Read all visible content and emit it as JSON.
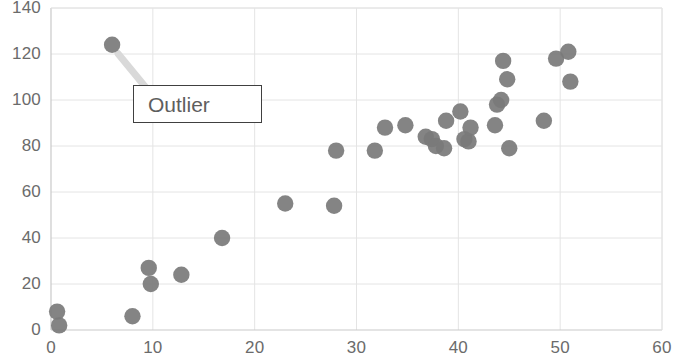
{
  "chart": {
    "type": "scatter",
    "title": "",
    "marker_color": "#7a7a7a",
    "grid_color": "#e4e4e4",
    "axis_color": "#d2d2d2",
    "tick_text_color": "#6b6b6b"
  },
  "annotation": {
    "label": "Outlier",
    "border_color": "#404040",
    "arrow_color": "#d9d9d9",
    "points_to_x": 6,
    "points_to_y": 124
  },
  "chart_data": {
    "type": "scatter",
    "title": "",
    "xlabel": "",
    "ylabel": "",
    "xlim": [
      0,
      60
    ],
    "ylim": [
      0,
      140
    ],
    "xticks": [
      0,
      10,
      20,
      30,
      40,
      50,
      60
    ],
    "yticks": [
      0,
      20,
      40,
      60,
      80,
      100,
      120,
      140
    ],
    "grid": true,
    "legend": null,
    "series": [
      {
        "name": "data",
        "color": "#7a7a7a",
        "marker": "circle",
        "points": [
          [
            0.6,
            8
          ],
          [
            0.8,
            2
          ],
          [
            6.0,
            124
          ],
          [
            8.0,
            6
          ],
          [
            9.6,
            27
          ],
          [
            9.8,
            20
          ],
          [
            12.8,
            24
          ],
          [
            16.8,
            40
          ],
          [
            23.0,
            55
          ],
          [
            27.8,
            54
          ],
          [
            28.0,
            78
          ],
          [
            31.8,
            78
          ],
          [
            32.8,
            88
          ],
          [
            34.8,
            89
          ],
          [
            36.8,
            84
          ],
          [
            37.4,
            83
          ],
          [
            37.8,
            80
          ],
          [
            38.6,
            79
          ],
          [
            38.8,
            91
          ],
          [
            40.2,
            95
          ],
          [
            40.6,
            83
          ],
          [
            41.0,
            82
          ],
          [
            41.2,
            88
          ],
          [
            43.6,
            89
          ],
          [
            43.8,
            98
          ],
          [
            44.2,
            100
          ],
          [
            44.4,
            117
          ],
          [
            44.8,
            109
          ],
          [
            45.0,
            79
          ],
          [
            48.4,
            91
          ],
          [
            49.6,
            118
          ],
          [
            50.8,
            121
          ],
          [
            51.0,
            108
          ]
        ]
      }
    ],
    "annotations": [
      {
        "text": "Outlier",
        "type": "callout-box",
        "target_point": [
          6,
          124
        ]
      }
    ]
  },
  "axes": {
    "y_tick_labels": [
      "140",
      "120",
      "100",
      "80",
      "60",
      "40",
      "20",
      "0"
    ],
    "x_tick_labels": [
      "0",
      "10",
      "20",
      "30",
      "40",
      "50",
      "60"
    ]
  }
}
